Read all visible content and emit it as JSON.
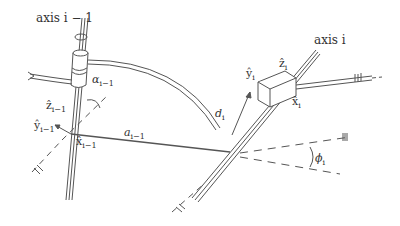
{
  "diagram": {
    "type": "Denavit-Hartenberg link frame parameters",
    "labels": {
      "axis_prev": "axis i − 1",
      "axis_curr": "axis i",
      "alpha": "α",
      "alpha_sub": "i−1",
      "a": "a",
      "a_sub": "i−1",
      "d": "d",
      "d_sub": "i",
      "phi": "ϕ",
      "phi_sub": "i",
      "z_prev": "ẑ",
      "z_prev_sub": "i−1",
      "y_prev": "ŷ",
      "y_prev_sub": "i−1",
      "x_prev": "x̂",
      "x_prev_sub": "i−1",
      "z_curr": "ẑ",
      "z_curr_sub": "i",
      "y_curr": "ŷ",
      "y_curr_sub": "i",
      "x_curr": "x̂",
      "x_curr_sub": "i"
    },
    "colors": {
      "stroke": "#555555",
      "text": "#333333",
      "background": "#ffffff"
    }
  }
}
